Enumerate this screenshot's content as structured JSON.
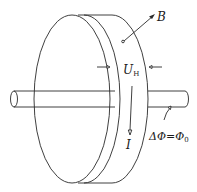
{
  "diagram": {
    "labels": {
      "magnetic_field": "B",
      "hall_voltage_main": "U",
      "hall_voltage_sub": "H",
      "current": "I",
      "flux_lhs": "ΔΦ",
      "flux_eq": "=",
      "flux_rhs_main": "Φ",
      "flux_rhs_sub": "0"
    },
    "colors": {
      "stroke": "#2a2a2a",
      "background": "#ffffff"
    }
  }
}
